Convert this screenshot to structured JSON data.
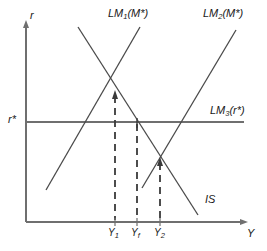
{
  "figure": {
    "type": "is-lm-diagram",
    "axes": {
      "y_axis_label": "r",
      "x_axis_label": "Y",
      "y_axis_marker": "r*",
      "origin": [
        26,
        222
      ],
      "x_axis_end": [
        247,
        222
      ],
      "y_axis_top": [
        26,
        22
      ]
    },
    "colors": {
      "axis": "#6f6f6f",
      "curve": "#4a4a4a",
      "dashed": "#3a3a3a",
      "text": "#1a1a1a",
      "background": "#ffffff"
    },
    "curves": [
      {
        "name": "LM1",
        "label_base": "LM",
        "label_sub": "1",
        "label_arg": "(M*)",
        "label_pos": [
          108,
          12
        ],
        "from": [
          46,
          190
        ],
        "to": [
          140,
          27
        ],
        "style": "solid"
      },
      {
        "name": "LM2",
        "label_base": "LM",
        "label_sub": "2",
        "label_arg": "(M*)",
        "label_pos": [
          203,
          12
        ],
        "from": [
          142,
          188
        ],
        "to": [
          236,
          30
        ],
        "style": "solid"
      },
      {
        "name": "LM3",
        "label_base": "LM",
        "label_sub": "3",
        "label_arg": "(r*)",
        "label_pos": [
          212,
          109
        ],
        "from": [
          26,
          122
        ],
        "to": [
          244,
          122
        ],
        "style": "solid-horizontal"
      },
      {
        "name": "IS",
        "label_base": "IS",
        "label_sub": "",
        "label_arg": "",
        "label_pos": [
          205,
          198
        ],
        "from": [
          78,
          27
        ],
        "to": [
          198,
          215
        ],
        "style": "solid"
      }
    ],
    "equilibria": [
      {
        "name": "E1",
        "x": 115,
        "y": 93,
        "tick_label": "Y",
        "tick_sub": "1"
      },
      {
        "name": "Ef",
        "x": 137,
        "y": 122,
        "tick_label": "Y",
        "tick_sub": "f"
      },
      {
        "name": "E2",
        "x": 160,
        "y": 160,
        "tick_label": "Y",
        "tick_sub": "2"
      }
    ],
    "tick_labels": [
      {
        "base": "Y",
        "sub": "1",
        "x": 110,
        "y": 228
      },
      {
        "base": "Y",
        "sub": "f",
        "x": 132,
        "y": 228
      },
      {
        "base": "Y",
        "sub": "2",
        "x": 155,
        "y": 228
      }
    ]
  }
}
